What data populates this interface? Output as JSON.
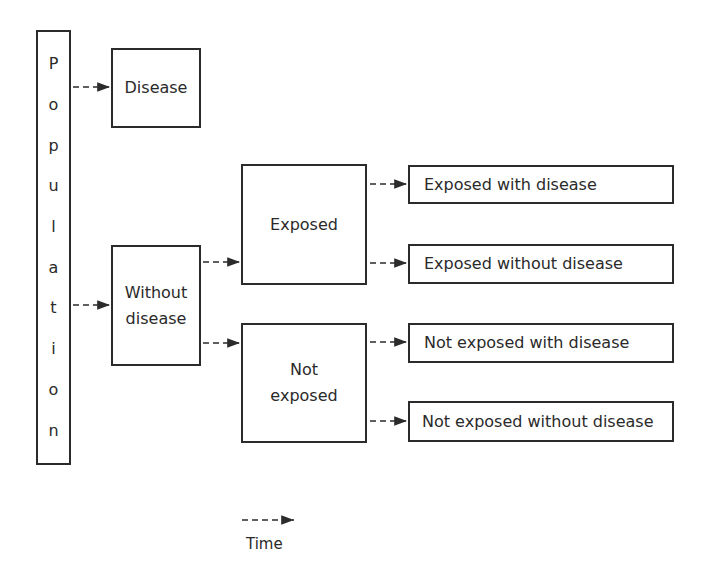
{
  "diagram": {
    "population_letters": [
      "P",
      "o",
      "p",
      "u",
      "l",
      "a",
      "t",
      "i",
      "o",
      "n"
    ],
    "population_label": "Population",
    "boxes": {
      "disease": "Disease",
      "without_disease_line1": "Without",
      "without_disease_line2": "disease",
      "exposed": "Exposed",
      "not_exposed_line1": "Not",
      "not_exposed_line2": "exposed",
      "exposed_with_disease": "Exposed with disease",
      "exposed_without_disease": "Exposed without disease",
      "not_exposed_with_disease": "Not exposed with disease",
      "not_exposed_without_disease": "Not exposed without disease"
    },
    "legend": {
      "label": "Time",
      "symbol": "dashed-arrow"
    },
    "edges": [
      {
        "from": "Population",
        "to": "Disease"
      },
      {
        "from": "Population",
        "to": "Without disease"
      },
      {
        "from": "Without disease",
        "to": "Exposed"
      },
      {
        "from": "Without disease",
        "to": "Not exposed"
      },
      {
        "from": "Exposed",
        "to": "Exposed with disease"
      },
      {
        "from": "Exposed",
        "to": "Exposed without disease"
      },
      {
        "from": "Not exposed",
        "to": "Not exposed with disease"
      },
      {
        "from": "Not exposed",
        "to": "Not exposed without disease"
      }
    ]
  }
}
